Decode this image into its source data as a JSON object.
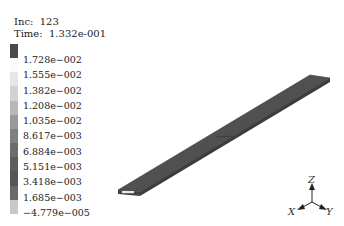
{
  "header": {
    "increment_label": "Inc:",
    "increment_value": "123",
    "time_label": "Time:",
    "time_value": "1.332e-001"
  },
  "legend": {
    "labels": [
      "1.728e−002",
      "1.555e−002",
      "1.382e−002",
      "1.208e−002",
      "1.035e−002",
      "8.617e−003",
      "6.884e−003",
      "5.151e−003",
      "3.418e−003",
      "1.685e−003",
      "−4.779e−005"
    ],
    "colors": [
      "#4a4a4a",
      "#fafafa",
      "#e6e6e6",
      "#d2d2d2",
      "#b8b8b8",
      "#9a9a9a",
      "#808080",
      "#6c6c6c",
      "#5c5c5c",
      "#555555",
      "#6a6a6a",
      "#c8c8c8"
    ]
  },
  "model": {
    "fill_color": "#505050",
    "edge_color": "#3a3a3a"
  },
  "triad": {
    "x_label": "X",
    "y_label": "Y",
    "z_label": "Z"
  }
}
